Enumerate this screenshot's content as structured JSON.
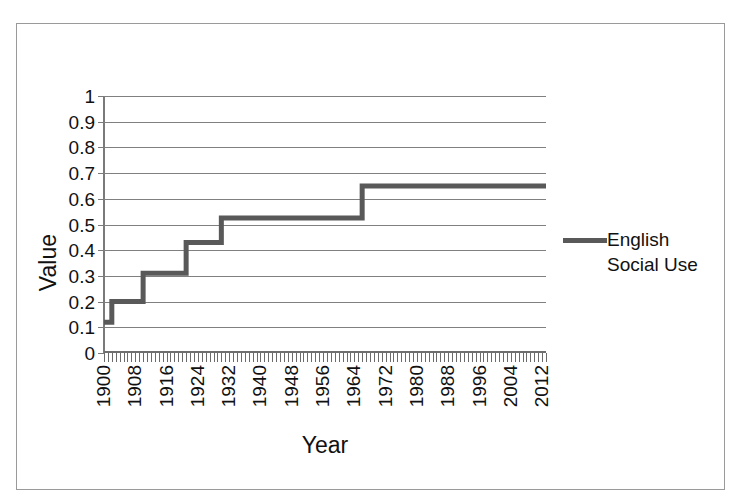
{
  "chart_data": {
    "type": "line",
    "title": "",
    "xlabel": "Year",
    "ylabel": "Value",
    "xlim": [
      1900,
      2013
    ],
    "ylim": [
      0,
      1
    ],
    "grid": true,
    "legend_position": "right",
    "step_style": "post",
    "series": [
      {
        "name": "English Social Use",
        "color": "#595959",
        "x": [
          1900,
          1902,
          1902,
          1910,
          1910,
          1921,
          1921,
          1930,
          1930,
          1966,
          1966,
          2013
        ],
        "values": [
          0.12,
          0.12,
          0.2,
          0.2,
          0.31,
          0.31,
          0.43,
          0.43,
          0.525,
          0.525,
          0.65,
          0.65
        ],
        "steps": [
          {
            "year_start": 1900,
            "year_end": 1902,
            "value": 0.12
          },
          {
            "year_start": 1902,
            "year_end": 1910,
            "value": 0.2
          },
          {
            "year_start": 1910,
            "year_end": 1921,
            "value": 0.31
          },
          {
            "year_start": 1921,
            "year_end": 1930,
            "value": 0.43
          },
          {
            "year_start": 1930,
            "year_end": 1966,
            "value": 0.525
          },
          {
            "year_start": 1966,
            "year_end": 2013,
            "value": 0.65
          }
        ]
      }
    ],
    "y_ticks": [
      0,
      0.1,
      0.2,
      0.3,
      0.4,
      0.5,
      0.6,
      0.7,
      0.8,
      0.9,
      1
    ],
    "y_tick_labels": [
      "0",
      "0.1",
      "0.2",
      "0.3",
      "0.4",
      "0.5",
      "0.6",
      "0.7",
      "0.8",
      "0.9",
      "1"
    ],
    "x_ticks": [
      1900,
      1908,
      1916,
      1924,
      1932,
      1940,
      1948,
      1956,
      1964,
      1972,
      1980,
      1988,
      1996,
      2004,
      2012
    ],
    "x_tick_labels": [
      "1900",
      "1908",
      "1916",
      "1924",
      "1932",
      "1940",
      "1948",
      "1956",
      "1964",
      "1972",
      "1980",
      "1988",
      "1996",
      "2004",
      "2012"
    ],
    "x_minor_tick_step": 1
  },
  "axes": {
    "y_title": "Value",
    "x_title": "Year"
  },
  "legend": {
    "entries": [
      {
        "label": "English Social Use",
        "color": "#595959"
      }
    ]
  },
  "colors": {
    "series": "#595959",
    "gridline": "#808080",
    "axis": "#6e6e6e",
    "border": "#9a9a9a",
    "background": "#ffffff",
    "text": "#111111"
  }
}
